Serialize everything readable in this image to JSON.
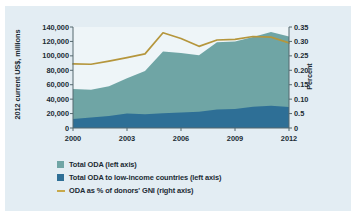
{
  "chart_data": {
    "type": "area",
    "title": "",
    "subtitle": "",
    "xlabel": "",
    "ylabel": "2012 current US$, millions",
    "ylabel_right": "Percent",
    "grid": false,
    "legend_position": "bottom-left",
    "x": [
      2000,
      2001,
      2002,
      2003,
      2004,
      2005,
      2006,
      2007,
      2008,
      2009,
      2010,
      2011,
      2012
    ],
    "xtick_labels": [
      "2000",
      "2003",
      "2006",
      "2009",
      "2012"
    ],
    "xticks": [
      2000,
      2003,
      2006,
      2009,
      2012
    ],
    "xlim": [
      2000,
      2012
    ],
    "ylim": [
      0,
      140000
    ],
    "yticks": [
      0,
      20000,
      40000,
      60000,
      80000,
      100000,
      120000,
      140000
    ],
    "ytick_labels": [
      "0",
      "20,000",
      "40,000",
      "60,000",
      "80,000",
      "100,000",
      "120,000",
      "140,000"
    ],
    "ylim_right": [
      0,
      0.35
    ],
    "yticks_right": [
      0,
      0.05,
      0.1,
      0.15,
      0.2,
      0.25,
      0.3,
      0.35
    ],
    "ytick_labels_right": [
      "0",
      "0.5",
      "0.10",
      "0.15",
      "0.20",
      "0.25",
      "0.30",
      "0.35"
    ],
    "series": [
      {
        "name": "Total ODA (left axis)",
        "type": "area",
        "axis": "left",
        "color": "#6fa5a5",
        "values": [
          54000,
          53000,
          58000,
          69000,
          79000,
          106000,
          104000,
          101000,
          119000,
          120000,
          126000,
          133000,
          127000
        ]
      },
      {
        "name": "Total ODA to low-income countries (left axis)",
        "type": "area",
        "axis": "left",
        "color": "#2e6f96",
        "values": [
          12500,
          14500,
          16500,
          20000,
          19000,
          20500,
          21500,
          22500,
          25500,
          26500,
          29500,
          31000,
          29000
        ]
      },
      {
        "name": "ODA as % of donors' GNI (right axis)",
        "type": "line",
        "axis": "right",
        "color": "#b5963c",
        "values": [
          0.222,
          0.221,
          0.232,
          0.244,
          0.257,
          0.33,
          0.31,
          0.283,
          0.305,
          0.307,
          0.317,
          0.315,
          0.295
        ]
      }
    ]
  },
  "legend": {
    "items": [
      {
        "label": "Total ODA (left axis)",
        "marker": "square",
        "color": "#6fa5a5"
      },
      {
        "label": "Total ODA to low-income countries (left axis)",
        "marker": "square",
        "color": "#2e6f96"
      },
      {
        "label": "ODA as % of donors' GNI (right axis)",
        "marker": "line",
        "color": "#c8a94a"
      }
    ]
  },
  "colors": {
    "background": "#e3edf3",
    "plot_background": "#eef5f8",
    "axis": "#55686f",
    "text": "#1b2b34",
    "total_oda": "#6fa5a5",
    "low_income_oda": "#2e6f96",
    "gni_line": "#b5963c"
  }
}
